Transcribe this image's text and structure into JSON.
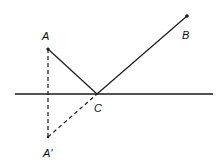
{
  "diagram": {
    "colors": {
      "stroke": "#1a1a1a",
      "background": "#ffffff"
    },
    "points": {
      "A": {
        "label": "A",
        "x": 48,
        "y": 49
      },
      "B": {
        "label": "B",
        "x": 187,
        "y": 16
      },
      "C": {
        "label": "C",
        "x": 97,
        "y": 94
      },
      "A_prime": {
        "label": "A'",
        "x": 48,
        "y": 137
      }
    },
    "labels": {
      "A": "A",
      "B": "B",
      "C": "C",
      "A_prime": "A'"
    },
    "mirror_line": {
      "x1": 15,
      "y1": 94,
      "x2": 213,
      "y2": 94
    },
    "segments": [
      {
        "from": "A",
        "to": "C",
        "style": "solid"
      },
      {
        "from": "C",
        "to": "B",
        "style": "solid"
      },
      {
        "from": "A",
        "to": "A_prime",
        "style": "dashed"
      },
      {
        "from": "A_prime",
        "to": "C",
        "style": "dashed"
      }
    ]
  }
}
